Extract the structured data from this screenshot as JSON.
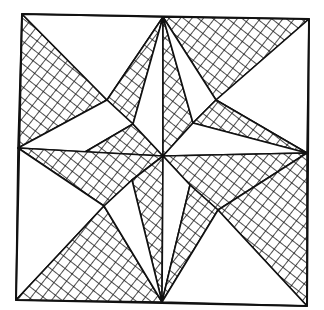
{
  "figure": {
    "style": "hand-drawn line art with crosshatched pieces",
    "colors": {
      "ink": "#111111",
      "background": "#ffffff"
    },
    "frame": {
      "points": [
        [
          22,
          14
        ],
        [
          309,
          19
        ],
        [
          307,
          306
        ],
        [
          16,
          300
        ]
      ]
    },
    "hub": [
      163,
      156
    ],
    "pieces": [
      {
        "name": "top-left-corner-triangle",
        "fill": "hatched",
        "points": [
          [
            22,
            14
          ],
          [
            107,
            100
          ],
          [
            18,
            148
          ]
        ]
      },
      {
        "name": "top-left-upper-plain",
        "fill": "plain",
        "points": [
          [
            22,
            14
          ],
          [
            163,
            17
          ],
          [
            107,
            100
          ]
        ]
      },
      {
        "name": "top-center-left-kite",
        "fill": "hatched",
        "points": [
          [
            163,
            17
          ],
          [
            133,
            124
          ],
          [
            107,
            100
          ]
        ]
      },
      {
        "name": "top-left-inner-plain",
        "fill": "plain",
        "points": [
          [
            107,
            100
          ],
          [
            133,
            124
          ],
          [
            85,
            152
          ],
          [
            18,
            148
          ]
        ]
      },
      {
        "name": "inner-left-upper-hatch",
        "fill": "hatched",
        "points": [
          [
            133,
            124
          ],
          [
            163,
            156
          ],
          [
            85,
            152
          ]
        ]
      },
      {
        "name": "inner-top-left-plain",
        "fill": "plain",
        "points": [
          [
            163,
            17
          ],
          [
            163,
            156
          ],
          [
            133,
            124
          ]
        ]
      },
      {
        "name": "top-right-large-triangle",
        "fill": "hatched",
        "points": [
          [
            163,
            17
          ],
          [
            309,
            19
          ],
          [
            216,
            100
          ]
        ]
      },
      {
        "name": "inner-top-right-hatch",
        "fill": "hatched",
        "points": [
          [
            163,
            17
          ],
          [
            193,
            123
          ],
          [
            163,
            156
          ]
        ]
      },
      {
        "name": "top-right-mid-plain",
        "fill": "plain",
        "points": [
          [
            163,
            17
          ],
          [
            216,
            100
          ],
          [
            193,
            123
          ]
        ]
      },
      {
        "name": "right-upper-plain",
        "fill": "plain",
        "points": [
          [
            309,
            19
          ],
          [
            307,
            153
          ],
          [
            216,
            100
          ]
        ]
      },
      {
        "name": "right-upper-hatch",
        "fill": "hatched",
        "points": [
          [
            216,
            100
          ],
          [
            307,
            153
          ],
          [
            193,
            123
          ]
        ]
      },
      {
        "name": "inner-right-upper-plain",
        "fill": "plain",
        "points": [
          [
            193,
            123
          ],
          [
            307,
            153
          ],
          [
            163,
            156
          ]
        ]
      },
      {
        "name": "left-lower-hatch",
        "fill": "hatched",
        "points": [
          [
            18,
            148
          ],
          [
            163,
            156
          ],
          [
            132,
            180
          ],
          [
            104,
            206
          ]
        ]
      },
      {
        "name": "left-lower-plain",
        "fill": "plain",
        "points": [
          [
            18,
            148
          ],
          [
            104,
            206
          ],
          [
            16,
            300
          ]
        ]
      },
      {
        "name": "bottom-left-triangle",
        "fill": "hatched",
        "points": [
          [
            16,
            300
          ],
          [
            104,
            206
          ],
          [
            162,
            302
          ]
        ]
      },
      {
        "name": "inner-bottom-left-hatch",
        "fill": "hatched",
        "points": [
          [
            132,
            180
          ],
          [
            163,
            156
          ],
          [
            162,
            302
          ]
        ]
      },
      {
        "name": "inner-bottom-left-plain",
        "fill": "plain",
        "points": [
          [
            104,
            206
          ],
          [
            132,
            180
          ],
          [
            162,
            302
          ]
        ]
      },
      {
        "name": "inner-right-lower-hatch",
        "fill": "hatched",
        "points": [
          [
            163,
            156
          ],
          [
            307,
            153
          ],
          [
            218,
            210
          ],
          [
            190,
            185
          ]
        ]
      },
      {
        "name": "inner-bottom-right-plain",
        "fill": "plain",
        "points": [
          [
            163,
            156
          ],
          [
            190,
            185
          ],
          [
            162,
            302
          ]
        ]
      },
      {
        "name": "bottom-center-right-hatch",
        "fill": "hatched",
        "points": [
          [
            190,
            185
          ],
          [
            218,
            210
          ],
          [
            162,
            302
          ]
        ]
      },
      {
        "name": "bottom-right-triangle",
        "fill": "hatched",
        "points": [
          [
            307,
            153
          ],
          [
            307,
            306
          ],
          [
            218,
            210
          ]
        ]
      },
      {
        "name": "bottom-right-plain",
        "fill": "plain",
        "points": [
          [
            218,
            210
          ],
          [
            307,
            306
          ],
          [
            162,
            302
          ]
        ]
      }
    ]
  }
}
